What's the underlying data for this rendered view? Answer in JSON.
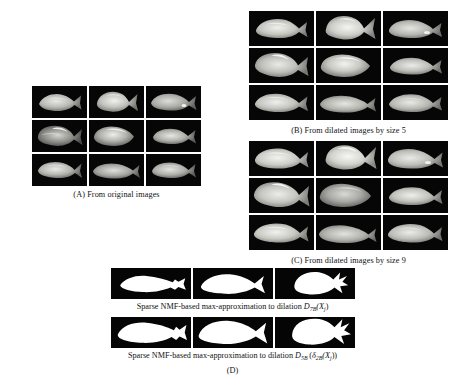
{
  "figure": {
    "panels": [
      {
        "id": "A",
        "caption": "(A)  From original images",
        "kind": "grayscale-fish-grid",
        "rows": 3,
        "cols": 3,
        "tiles": [
          "fish-grayscale-1",
          "fish-grayscale-2",
          "fish-grayscale-3",
          "fish-grayscale-4",
          "fish-grayscale-5",
          "fish-grayscale-6",
          "fish-grayscale-7",
          "fish-grayscale-8",
          "fish-grayscale-9"
        ]
      },
      {
        "id": "B",
        "caption": "(B)  From dilated images by size 5",
        "kind": "grayscale-fish-grid",
        "rows": 3,
        "cols": 3,
        "tiles": [
          "fish-dilated5-1",
          "fish-dilated5-2",
          "fish-dilated5-3",
          "fish-dilated5-4",
          "fish-dilated5-5",
          "fish-dilated5-6",
          "fish-dilated5-7",
          "fish-dilated5-8",
          "fish-dilated5-9"
        ]
      },
      {
        "id": "C",
        "caption": "(C)  From dilated images by size 9",
        "kind": "grayscale-fish-grid",
        "rows": 3,
        "cols": 3,
        "tiles": [
          "fish-dilated9-1",
          "fish-dilated9-2",
          "fish-dilated9-3",
          "fish-dilated9-4",
          "fish-dilated9-5",
          "fish-dilated9-6",
          "fish-dilated9-7",
          "fish-dilated9-8",
          "fish-dilated9-9"
        ]
      }
    ],
    "panel_d": {
      "label": "(D)",
      "rows": [
        {
          "caption_prefix": "Sparse NMF-based max-approximation to dilation ",
          "formula": {
            "operator": "D",
            "operator_subscript": "7B",
            "argument": "(X",
            "argument_subscript": "j",
            "argument_close": ")"
          },
          "tiles": [
            "fish-binary-thin-1",
            "fish-binary-thin-2",
            "fish-binary-thin-3"
          ]
        },
        {
          "caption_prefix": "Sparse NMF-based max-approximation to dilation ",
          "formula": {
            "operator": "D",
            "operator_subscript": "5B",
            "inner_operator": "δ",
            "inner_subscript": "2B",
            "argument": "(X",
            "argument_subscript": "j",
            "argument_close": ")"
          },
          "tiles": [
            "fish-binary-thick-1",
            "fish-binary-thick-2",
            "fish-binary-thick-3"
          ]
        }
      ]
    },
    "colors": {
      "page_background": "#ffffff",
      "tile_background": "#050505",
      "binary_foreground": "#ffffff",
      "text": "#121212"
    }
  }
}
